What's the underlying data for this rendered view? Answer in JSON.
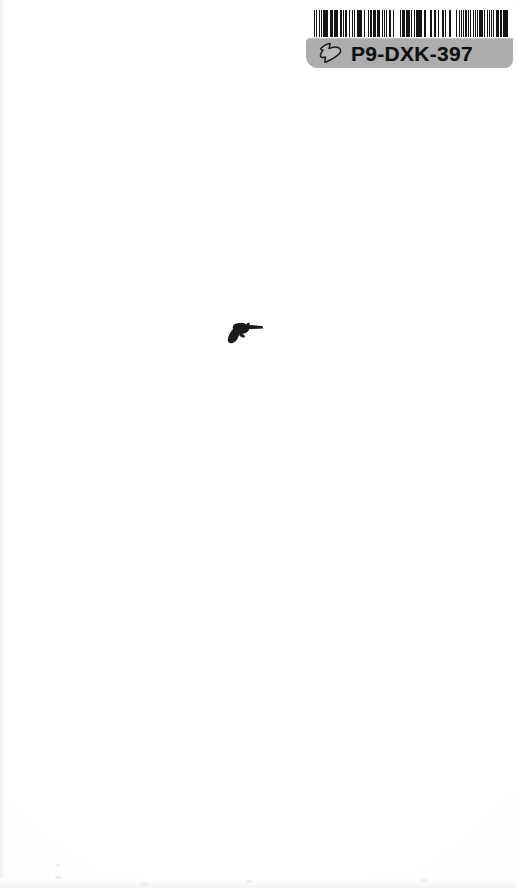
{
  "page": {
    "kind": "scanned-book-cover",
    "background_color": "#fefefe",
    "width_px": 516,
    "height_px": 888
  },
  "barcode_label": {
    "code_text": "P9-DXK-397",
    "label_background_color": "#adadad",
    "code_text_color": "#101010",
    "bar_color": "#151515",
    "hand_icon_name": "pointing-hand-icon",
    "barcode_pattern": [
      2,
      2,
      1,
      4,
      2,
      1,
      1,
      3,
      1,
      1,
      2,
      1,
      3,
      1,
      1,
      2,
      1,
      1,
      3,
      2,
      1,
      1,
      2,
      1,
      1,
      4,
      1,
      1,
      2,
      1,
      2,
      2,
      1,
      1,
      1,
      3,
      2,
      1,
      1,
      1,
      3,
      1,
      2,
      1,
      1,
      2,
      2,
      1,
      1,
      1,
      3,
      1,
      1,
      2,
      1,
      3,
      1,
      1,
      2,
      2,
      1,
      1,
      1,
      2,
      3,
      1,
      1,
      1,
      2,
      1,
      3,
      1,
      1,
      2,
      1,
      1,
      2,
      3,
      1,
      1,
      1,
      1,
      3,
      2,
      1,
      1,
      2,
      1,
      1,
      3,
      1,
      2,
      1,
      1,
      2,
      2,
      1,
      1,
      3,
      1,
      2,
      1,
      1,
      1,
      2,
      3,
      1,
      1,
      1,
      2,
      2,
      1,
      3,
      1,
      1,
      1,
      2,
      1,
      1,
      4,
      1,
      1,
      2,
      2,
      1,
      3,
      1,
      1,
      1,
      2,
      1,
      1,
      3,
      2,
      1,
      1,
      2,
      1,
      1,
      3,
      1,
      1,
      2,
      1,
      2,
      3,
      1,
      1,
      1,
      1,
      2,
      2,
      1,
      3,
      1,
      1,
      2,
      1,
      1,
      2,
      1,
      1,
      3,
      1,
      1,
      2,
      2,
      1,
      1,
      1,
      2,
      3,
      1,
      1,
      1,
      2,
      1,
      1,
      3,
      2,
      1,
      1,
      2,
      1,
      1,
      1,
      3,
      1,
      2,
      1,
      1,
      2,
      2,
      1,
      1,
      3,
      1,
      1,
      2,
      2,
      1,
      1,
      3,
      1,
      1,
      2,
      1,
      1,
      2,
      1,
      3,
      1,
      1,
      1,
      2,
      2
    ]
  },
  "illustration": {
    "name": "revolver-silhouette",
    "fill_color": "#1b1b1b"
  }
}
